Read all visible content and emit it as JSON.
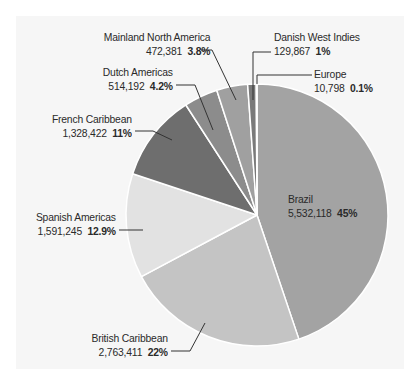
{
  "chart_data": {
    "type": "pie",
    "title": "",
    "start_angle": "12 o'clock",
    "direction": "clockwise",
    "slices": [
      {
        "name": "Brazil",
        "value": 5532118,
        "percent_label": "45%",
        "value_label": "5,532,118",
        "color": "#a3a3a3"
      },
      {
        "name": "British Caribbean",
        "value": 2763411,
        "percent_label": "22%",
        "value_label": "2,763,411",
        "color": "#c4c4c4"
      },
      {
        "name": "Spanish Americas",
        "value": 1591245,
        "percent_label": "12.9%",
        "value_label": "1,591,245",
        "color": "#e2e2e2"
      },
      {
        "name": "French Caribbean",
        "value": 1328422,
        "percent_label": "11%",
        "value_label": "1,328,422",
        "color": "#6e6e6e"
      },
      {
        "name": "Dutch Americas",
        "value": 514192,
        "percent_label": "4.2%",
        "value_label": "514,192",
        "color": "#8c8c8c"
      },
      {
        "name": "Mainland North America",
        "value": 472381,
        "percent_label": "3.8%",
        "value_label": "472,381",
        "color": "#a0a0a0"
      },
      {
        "name": "Danish West Indies",
        "value": 129867,
        "percent_label": "1%",
        "value_label": "129,867",
        "color": "#7a7a7a"
      },
      {
        "name": "Europe",
        "value": 10798,
        "percent_label": "0.1%",
        "value_label": "10,798",
        "color": "#555555"
      }
    ],
    "categories": [
      "Brazil",
      "British Caribbean",
      "Spanish Americas",
      "French Caribbean",
      "Dutch Americas",
      "Mainland North America",
      "Danish West Indies",
      "Europe"
    ],
    "values": [
      5532118,
      2763411,
      1591245,
      1328422,
      514192,
      472381,
      129867,
      10798
    ],
    "percentages": [
      45,
      22,
      12.9,
      11,
      4.2,
      3.8,
      1,
      0.1
    ],
    "legend": "none (leader-line labels)",
    "grid": false
  },
  "labels": {
    "brazil": {
      "name": "Brazil",
      "value": "5,532,118",
      "pct": "45%"
    },
    "british": {
      "name": "British Caribbean",
      "value": "2,763,411",
      "pct": "22%"
    },
    "spanish": {
      "name": "Spanish Americas",
      "value": "1,591,245",
      "pct": "12.9%"
    },
    "french": {
      "name": "French Caribbean",
      "value": "1,328,422",
      "pct": "11%"
    },
    "dutch": {
      "name": "Dutch Americas",
      "value": "514,192",
      "pct": "4.2%"
    },
    "mainland": {
      "name": "Mainland North America",
      "value": "472,381",
      "pct": "3.8%"
    },
    "danish": {
      "name": "Danish West Indies",
      "value": "129,867",
      "pct": "1%"
    },
    "europe": {
      "name": "Europe",
      "value": "10,798",
      "pct": "0.1%"
    }
  }
}
